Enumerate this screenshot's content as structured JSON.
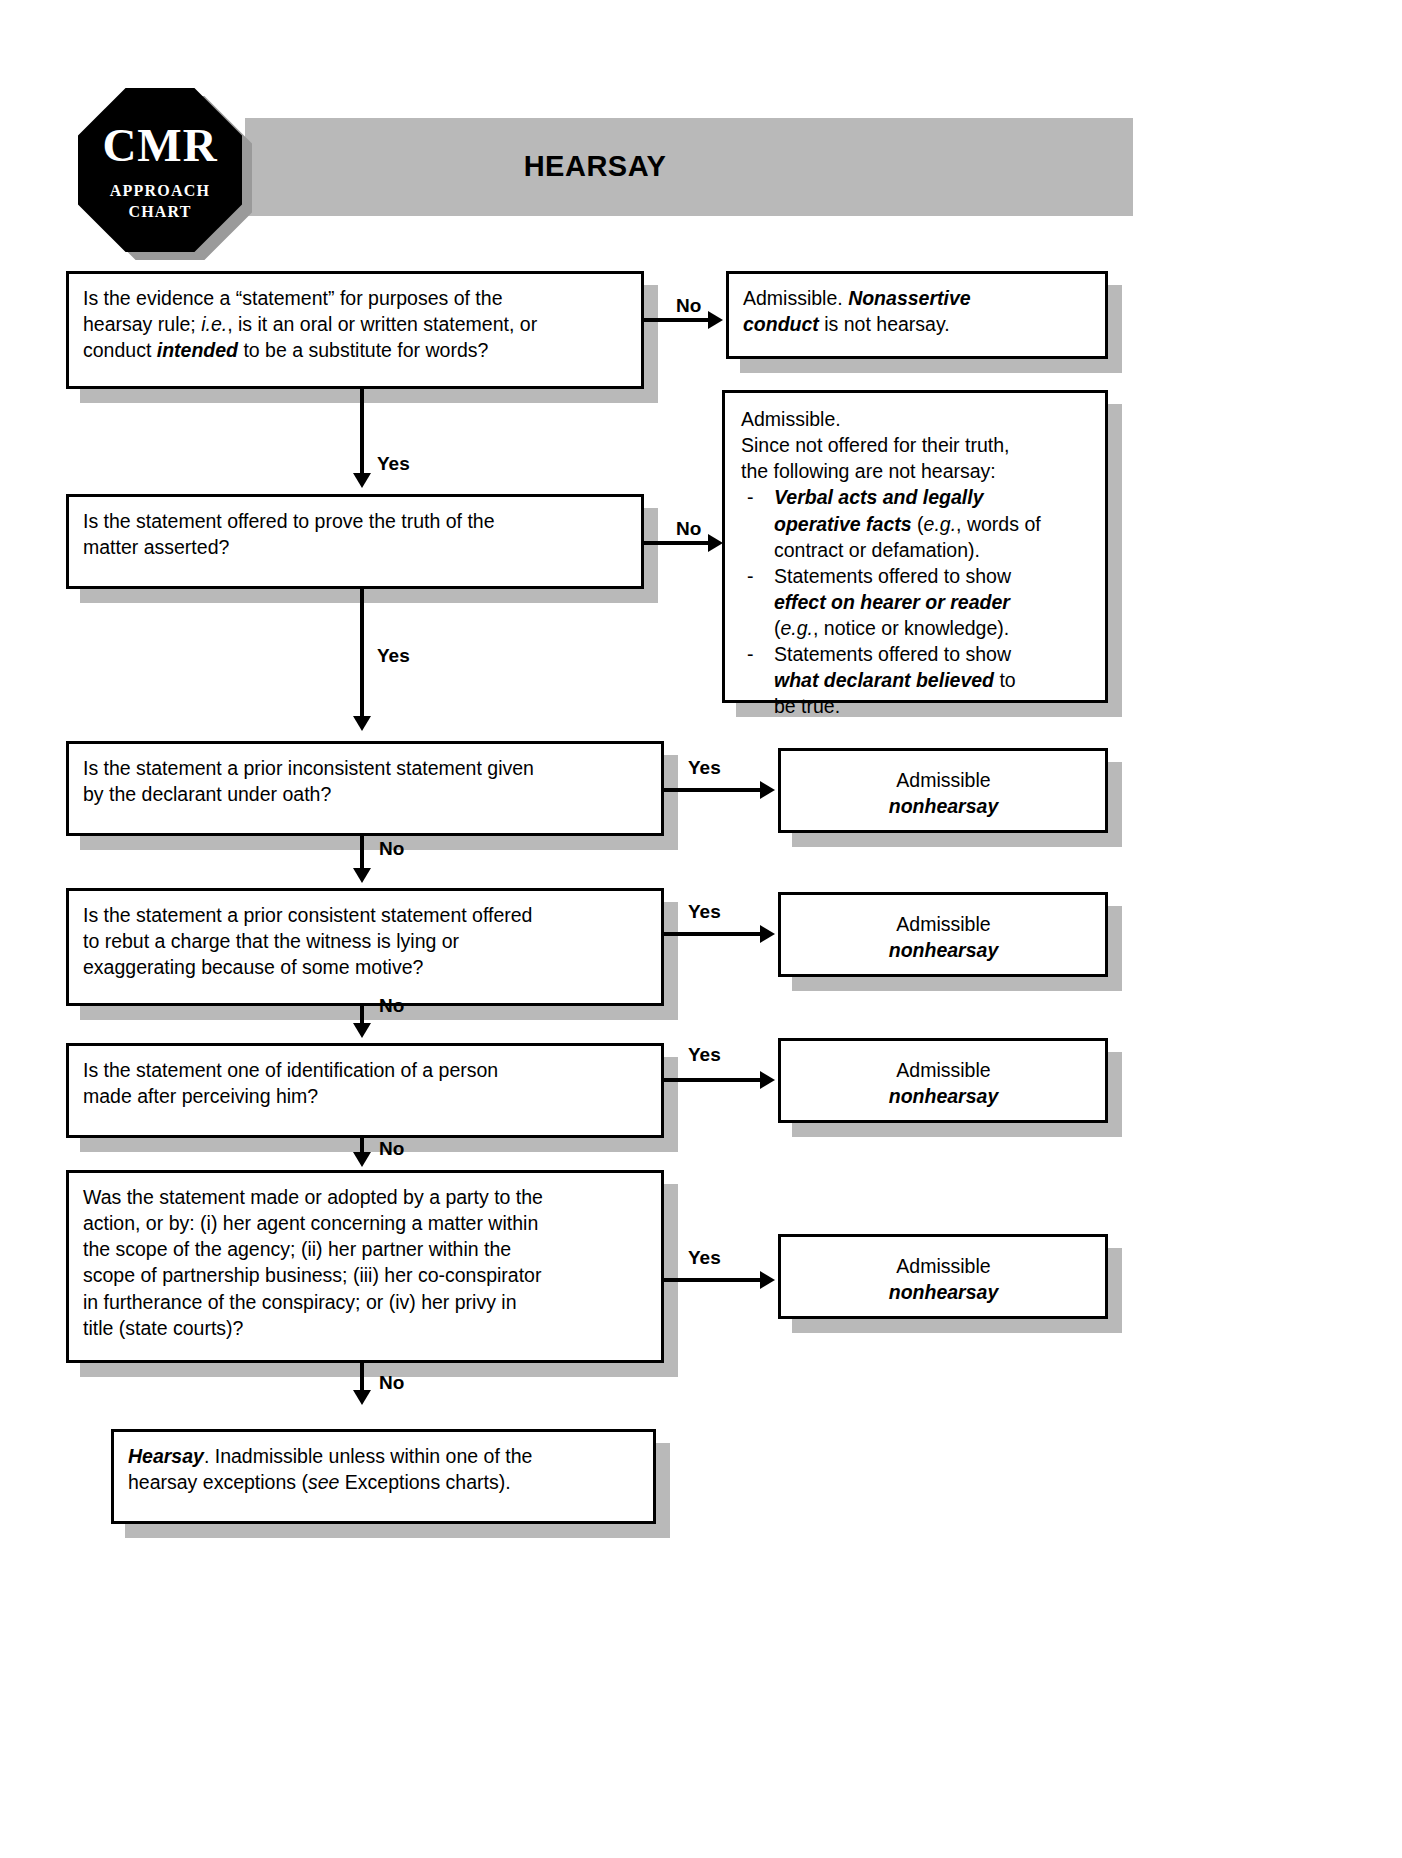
{
  "header": {
    "logo": {
      "main": "CMR",
      "line1": "APPROACH",
      "line2": "CHART"
    },
    "title": "HEARSAY"
  },
  "colors": {
    "banner_gray": "#b9b9b9",
    "shadow_gray": "#b9b9b9",
    "border_black": "#000000",
    "box_fill": "#ffffff"
  },
  "edge_labels": {
    "no": "No",
    "yes": "Yes"
  },
  "nodes": {
    "q1": {
      "id": "q1",
      "type": "decision",
      "text_plain": "Is the evidence a “statement” for purposes of the hearsay rule; i.e., is it an oral or written statement, or conduct intended to be a substitute for words?",
      "lines": [
        "Is the evidence a “statement” for purposes of the",
        "hearsay rule; i.e., is it an oral or written statement, or",
        "conduct intended to be a substitute for words?"
      ]
    },
    "q2": {
      "id": "q2",
      "type": "decision",
      "text_plain": "Is the statement offered to prove the truth of the matter asserted?",
      "lines": [
        "Is the statement offered to prove the truth of the",
        "matter asserted?"
      ]
    },
    "q3": {
      "id": "q3",
      "type": "decision",
      "text_plain": "Is the statement a prior inconsistent statement given by the declarant under oath?",
      "lines": [
        "Is the statement a prior inconsistent statement given",
        "by the declarant under oath?"
      ]
    },
    "q4": {
      "id": "q4",
      "type": "decision",
      "text_plain": "Is the statement a prior consistent statement offered to rebut a charge that the witness is lying or exaggerating because of some motive?",
      "lines": [
        "Is the statement a prior consistent statement offered",
        "to rebut a charge that the witness is lying or",
        "exaggerating because of some motive?"
      ]
    },
    "q5": {
      "id": "q5",
      "type": "decision",
      "text_plain": "Is the statement one of identification of a person made after perceiving him?",
      "lines": [
        "Is the statement one of identification of a person",
        "made after perceiving him?"
      ]
    },
    "q6": {
      "id": "q6",
      "type": "decision",
      "text_plain": "Was the statement made or adopted by a party to the action, or by: (i) her agent concerning a matter within the scope of the agency; (ii) her partner within the scope of partnership business; (iii) her co-conspirator in furtherance of the conspiracy; or (iv) her privy in title (state courts)?",
      "lines": [
        "Was the statement made or adopted by a party to the",
        "action, or by: (i) her agent concerning a matter within",
        "the scope of the agency; (ii) her partner within the",
        "scope of partnership business; (iii) her co-conspirator",
        "in furtherance of the conspiracy; or (iv) her privy in",
        "title (state courts)?"
      ]
    },
    "r1": {
      "id": "r1",
      "type": "outcome",
      "text_plain": "Admissible. Nonassertive conduct is not hearsay.",
      "prefix": "Admissible. ",
      "emphasis1": "Nonassertive",
      "emphasis2": "conduct",
      "suffix": " is not hearsay."
    },
    "r2": {
      "id": "r2",
      "type": "outcome",
      "intro_line1": "Admissible.",
      "intro_line2": "Since not offered for their truth,",
      "intro_line3": "the following are not hearsay:",
      "bullets": [
        {
          "emph_line1": "Verbal acts and legally",
          "emph_line2": "operative facts",
          "tail_line2": " (e.g., words of",
          "tail_line3": "contract or defamation)."
        },
        {
          "plain_line1": "Statements offered to show",
          "emph_line2": "effect on hearer or reader",
          "tail_line3": "(e.g., notice or knowledge)."
        },
        {
          "plain_line1": "Statements offered to show",
          "emph_line2": "what declarant believed",
          "tail_line2": " to",
          "tail_line3": "be  true."
        }
      ]
    },
    "r3": {
      "id": "r3",
      "type": "outcome",
      "line1": "Admissible",
      "line2": "nonhearsay"
    },
    "r4": {
      "id": "r4",
      "type": "outcome",
      "line1": "Admissible",
      "line2": "nonhearsay"
    },
    "r5": {
      "id": "r5",
      "type": "outcome",
      "line1": "Admissible",
      "line2": "nonhearsay"
    },
    "r6": {
      "id": "r6",
      "type": "outcome",
      "line1": "Admissible",
      "line2": "nonhearsay"
    },
    "terminal": {
      "id": "terminal",
      "type": "terminal",
      "text_plain": "Hearsay. Inadmissible unless within one of the hearsay exceptions (see Exceptions charts).",
      "emphasis": "Hearsay",
      "line1_tail": ". Inadmissible unless within one of the",
      "line2_a": "hearsay exceptions (",
      "line2_italic": "see",
      "line2_b": " Exceptions charts)."
    }
  },
  "flow": {
    "edges": [
      {
        "from": "q1",
        "to": "r1",
        "label": "No",
        "direction": "right"
      },
      {
        "from": "q1",
        "to": "q2",
        "label": "Yes",
        "direction": "down"
      },
      {
        "from": "q2",
        "to": "r2",
        "label": "No",
        "direction": "right"
      },
      {
        "from": "q2",
        "to": "q3",
        "label": "Yes",
        "direction": "down"
      },
      {
        "from": "q3",
        "to": "r3",
        "label": "Yes",
        "direction": "right"
      },
      {
        "from": "q3",
        "to": "q4",
        "label": "No",
        "direction": "down"
      },
      {
        "from": "q4",
        "to": "r4",
        "label": "Yes",
        "direction": "right"
      },
      {
        "from": "q4",
        "to": "q5",
        "label": "No",
        "direction": "down"
      },
      {
        "from": "q5",
        "to": "r5",
        "label": "Yes",
        "direction": "right"
      },
      {
        "from": "q5",
        "to": "q6",
        "label": "No",
        "direction": "down"
      },
      {
        "from": "q6",
        "to": "r6",
        "label": "Yes",
        "direction": "right"
      },
      {
        "from": "q6",
        "to": "terminal",
        "label": "No",
        "direction": "down"
      }
    ]
  }
}
